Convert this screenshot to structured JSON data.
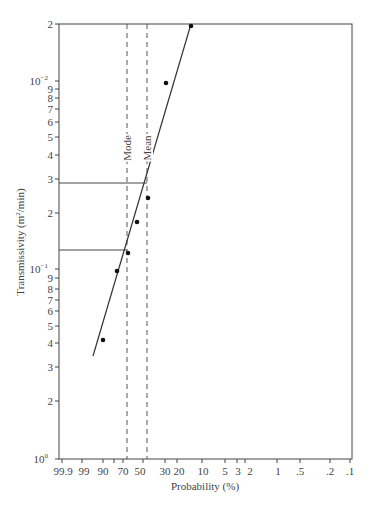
{
  "chart_data": {
    "type": "scatter",
    "title": "",
    "xlabel": "Probability (%)",
    "ylabel": "Transmissivity (m²/min)",
    "x_scale": "probability",
    "y_scale": "log",
    "x_ticks": [
      "99.9",
      "99",
      "90",
      "70",
      "50",
      "30",
      "20",
      "10",
      "5",
      "3",
      "2",
      "1",
      ".5",
      ".2",
      ".1"
    ],
    "y_ticks": [
      "2",
      "10⁻²",
      "9",
      "8",
      "7",
      "6",
      "5",
      "4",
      "3",
      "2",
      "10⁻¹",
      "9",
      "8",
      "7",
      "6",
      "5",
      "4",
      "3",
      "2",
      "10⁰"
    ],
    "grid": false,
    "series": [
      {
        "name": "observed",
        "type": "scatter",
        "points_px": [
          [
            191,
            26
          ],
          [
            166,
            83
          ],
          [
            148,
            198
          ],
          [
            137,
            222
          ],
          [
            128,
            253
          ],
          [
            117,
            271
          ],
          [
            103,
            340
          ]
        ]
      },
      {
        "name": "fit line",
        "type": "line",
        "points_px": [
          [
            93,
            356
          ],
          [
            191,
            24
          ]
        ]
      }
    ],
    "annotations": [
      {
        "label": "Mode",
        "type": "vertical-dashed",
        "x_px": 127
      },
      {
        "label": "Mean",
        "type": "vertical-dashed",
        "x_px": 147
      },
      {
        "type": "horizontal-line",
        "y_px": 183,
        "to_x_px": 147
      },
      {
        "type": "horizontal-line",
        "y_px": 250,
        "to_x_px": 127
      }
    ]
  },
  "axes": {
    "xlabel": "Probability (%)",
    "ylabel_main": "Transmissivity (m",
    "ylabel_sup": "2",
    "ylabel_tail": "/min)"
  },
  "annotations": {
    "mode": "Mode",
    "mean": "Mean"
  },
  "y_tick_labels": [
    {
      "base": "2",
      "exp": "",
      "y": 24
    },
    {
      "base": "10",
      "exp": "−2",
      "y": 81
    },
    {
      "base": "9",
      "exp": "",
      "y": 89
    },
    {
      "base": "8",
      "exp": "",
      "y": 98
    },
    {
      "base": "7",
      "exp": "",
      "y": 109
    },
    {
      "base": "6",
      "exp": "",
      "y": 122
    },
    {
      "base": "5",
      "exp": "",
      "y": 137
    },
    {
      "base": "4",
      "exp": "",
      "y": 155
    },
    {
      "base": "3",
      "exp": "",
      "y": 179
    },
    {
      "base": "2",
      "exp": "",
      "y": 213
    },
    {
      "base": "10",
      "exp": "−1",
      "y": 269
    },
    {
      "base": "9",
      "exp": "",
      "y": 278
    },
    {
      "base": "8",
      "exp": "",
      "y": 289
    },
    {
      "base": "7",
      "exp": "",
      "y": 300
    },
    {
      "base": "6",
      "exp": "",
      "y": 311
    },
    {
      "base": "5",
      "exp": "",
      "y": 326
    },
    {
      "base": "4",
      "exp": "",
      "y": 343
    },
    {
      "base": "3",
      "exp": "",
      "y": 367
    },
    {
      "base": "2",
      "exp": "",
      "y": 401
    },
    {
      "base": "10",
      "exp": "0",
      "y": 459
    }
  ],
  "x_tick_labels": [
    {
      "label": "99.9",
      "x": 63
    },
    {
      "label": "99",
      "x": 84
    },
    {
      "label": "90",
      "x": 103
    },
    {
      "label": "70",
      "x": 123
    },
    {
      "label": "50",
      "x": 140
    },
    {
      "label": "30",
      "x": 165
    },
    {
      "label": "20",
      "x": 179
    },
    {
      "label": "10",
      "x": 203
    },
    {
      "label": "5",
      "x": 225
    },
    {
      "label": "3",
      "x": 238
    },
    {
      "label": "2",
      "x": 250
    },
    {
      "label": "1",
      "x": 278
    },
    {
      "label": ".5",
      "x": 300
    },
    {
      "label": ".2",
      "x": 330
    },
    {
      "label": ".1",
      "x": 350
    }
  ],
  "x_tick_marks": [
    62,
    82,
    103,
    114,
    123,
    143,
    165,
    177,
    202,
    225,
    237,
    245,
    277,
    300,
    330,
    350
  ]
}
